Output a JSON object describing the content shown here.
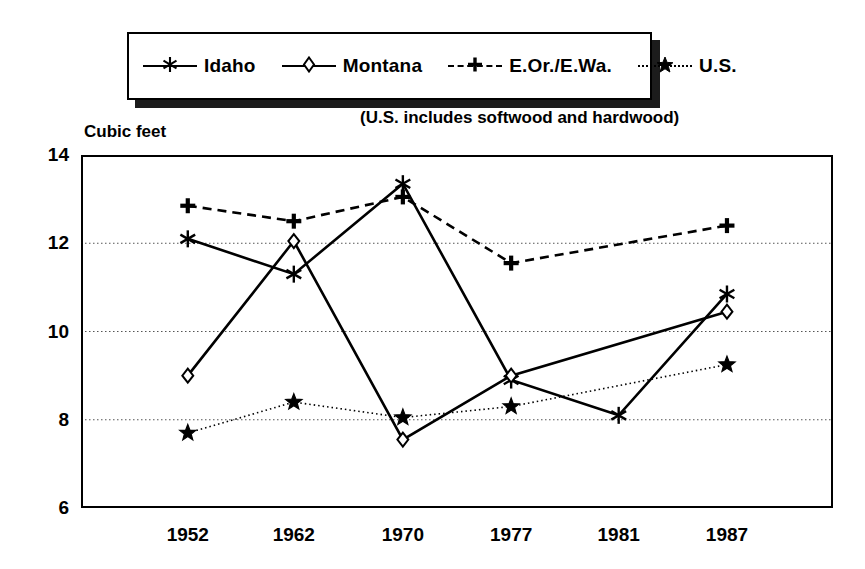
{
  "chart_data": {
    "type": "line",
    "title": "",
    "subtitle": "",
    "note": "(U.S. includes softwood and hardwood)",
    "ylabel": "Cubic feet",
    "xlabel": "",
    "categories": [
      "1952",
      "1962",
      "1970",
      "1977",
      "1981",
      "1987"
    ],
    "ylim": [
      6,
      14
    ],
    "yticks": [
      6,
      8,
      10,
      12,
      14
    ],
    "grid": "horizontal-dotted",
    "legend_position": "top",
    "series": [
      {
        "name": "Idaho",
        "marker": "asterisk",
        "line": "solid",
        "color": "#000000",
        "values": [
          12.1,
          11.3,
          13.35,
          8.9,
          8.1,
          10.85
        ]
      },
      {
        "name": "Montana",
        "marker": "diamond",
        "line": "solid",
        "color": "#000000",
        "values": [
          9.0,
          12.05,
          7.55,
          9.0,
          null,
          10.45
        ]
      },
      {
        "name": "E.Or./E.Wa.",
        "marker": "plus",
        "line": "dashed",
        "color": "#000000",
        "values": [
          12.85,
          12.5,
          13.05,
          11.55,
          null,
          12.4
        ]
      },
      {
        "name": "U.S.",
        "marker": "star",
        "line": "dotted",
        "color": "#000000",
        "values": [
          7.7,
          8.4,
          8.05,
          8.3,
          null,
          9.25
        ]
      }
    ]
  },
  "legend": {
    "items": [
      {
        "label": "Idaho"
      },
      {
        "label": "Montana"
      },
      {
        "label": "E.Or./E.Wa."
      },
      {
        "label": "U.S."
      }
    ]
  }
}
